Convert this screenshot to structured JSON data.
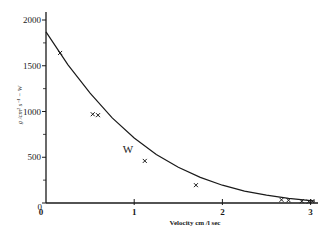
{
  "chart_data": {
    "type": "scatter",
    "title": "",
    "xlabel": "Velocity cm /l sec",
    "ylabel": "g /cm² s⁻¹ − W",
    "xlim": [
      0,
      3.1
    ],
    "ylim": [
      0,
      2100
    ],
    "x_ticks": [
      0,
      1,
      2,
      3
    ],
    "x_tick_labels": [
      "0",
      "1",
      "2",
      "3"
    ],
    "y_ticks": [
      0,
      500,
      1000,
      1500,
      2000
    ],
    "y_tick_labels": [
      "0",
      "500",
      "1000",
      "1500",
      "2000"
    ],
    "y_minor_ticks": [
      250,
      750,
      1250,
      1750
    ],
    "grid": false,
    "legend": null,
    "annotations": [
      {
        "text": "W",
        "x": 0.87,
        "y": 550
      }
    ],
    "series": [
      {
        "name": "measured",
        "marker": "x",
        "x": [
          0.16,
          0.53,
          0.59,
          1.12,
          1.7,
          2.67,
          2.75,
          2.9,
          2.98,
          3.02
        ],
        "y": [
          1640,
          970,
          960,
          460,
          195,
          35,
          30,
          20,
          15,
          20
        ]
      },
      {
        "name": "fitted curve",
        "type": "line",
        "x": [
          0,
          0.25,
          0.5,
          0.75,
          1.0,
          1.25,
          1.5,
          1.75,
          2.0,
          2.25,
          2.5,
          2.75,
          3.0,
          3.05
        ],
        "y": [
          1870,
          1510,
          1200,
          930,
          710,
          530,
          390,
          280,
          195,
          130,
          85,
          50,
          25,
          20
        ]
      }
    ]
  }
}
